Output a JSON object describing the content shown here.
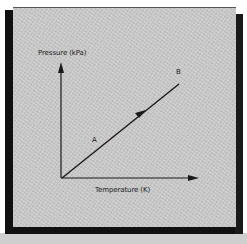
{
  "diagram": {
    "y_axis_label": "Pressure (kPa)",
    "x_axis_label": "Temperature (K)",
    "point_labels": {
      "a": "A",
      "b": "B"
    },
    "line": {
      "from": "origin",
      "to": "B",
      "direction_arrow": "toward B",
      "description": "straight line, pressure directly proportional to temperature"
    },
    "colors": {
      "panel_background": "#cbcbcb",
      "frame": "#111111",
      "ink": "#1a1a1a"
    }
  }
}
